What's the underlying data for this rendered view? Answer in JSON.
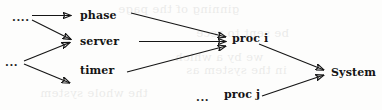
{
  "figure": {
    "type": "node-arrow-diagram",
    "width": 382,
    "height": 110,
    "background_color": "#fdfdfc",
    "ink_color": "#151515"
  },
  "nodes": {
    "source_top_dots": "....",
    "source_bottom_dots": "...",
    "phase": "phase",
    "server": "server",
    "timer": "timer",
    "proc_i": "proc i",
    "proc_j_dots": "...",
    "proc_j": "proc j",
    "system": "System"
  },
  "edges": [
    {
      "from": "source_top_dots",
      "to": "phase"
    },
    {
      "from": "source_top_dots",
      "to": "server"
    },
    {
      "from": "source_bottom_dots",
      "to": "server"
    },
    {
      "from": "source_bottom_dots",
      "to": "timer"
    },
    {
      "from": "phase",
      "to": "proc_i"
    },
    {
      "from": "server",
      "to": "proc_i"
    },
    {
      "from": "timer",
      "to": "proc_i"
    },
    {
      "from": "proc_i",
      "to": "system"
    },
    {
      "from": "proc_j",
      "to": "system"
    }
  ],
  "bleed_through": {
    "line1": "ginning of the page",
    "line2": "be sent to rece",
    "line3": "we by a which",
    "line4": "in the system as",
    "line5": "the whole system"
  }
}
